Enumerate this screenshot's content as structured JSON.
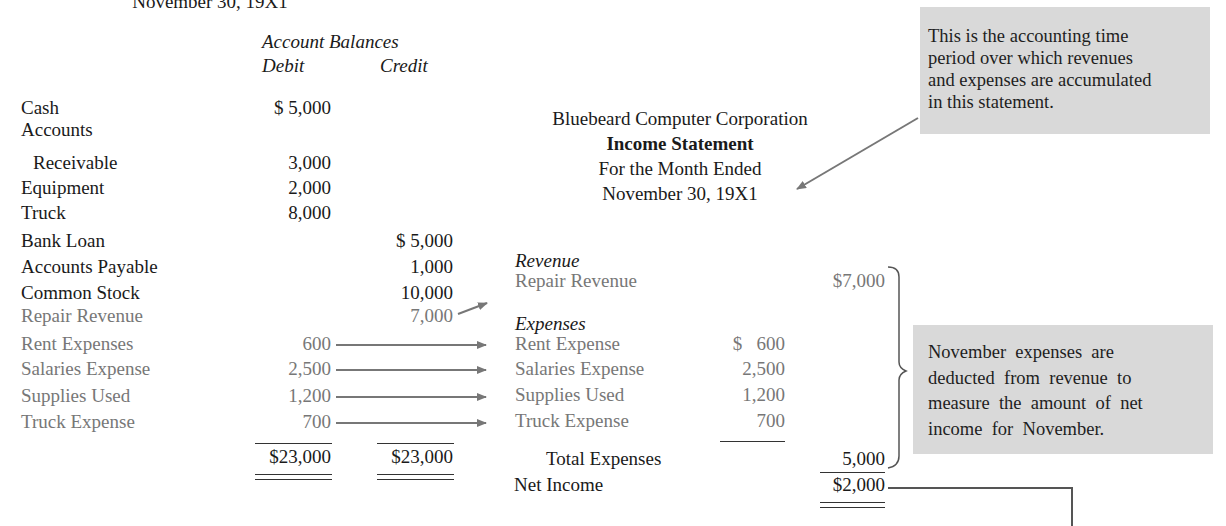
{
  "trial_balance": {
    "date_fragment": "November 30, 19X1",
    "heading": "Account Balances",
    "col_debit": "Debit",
    "col_credit": "Credit",
    "rows": [
      {
        "account": "Cash",
        "debit": "$ 5,000",
        "credit": "",
        "gray": false
      },
      {
        "account": "Accounts",
        "debit": "",
        "credit": "",
        "gray": false
      },
      {
        "account": "Receivable",
        "debit": "3,000",
        "credit": "",
        "gray": false,
        "indent": true
      },
      {
        "account": "Equipment",
        "debit": "2,000",
        "credit": "",
        "gray": false
      },
      {
        "account": "Truck",
        "debit": "8,000",
        "credit": "",
        "gray": false
      },
      {
        "account": "Bank Loan",
        "debit": "",
        "credit": "$ 5,000",
        "gray": false
      },
      {
        "account": "Accounts Payable",
        "debit": "",
        "credit": "1,000",
        "gray": false
      },
      {
        "account": "Common Stock",
        "debit": "",
        "credit": "10,000",
        "gray": false
      },
      {
        "account": "Repair Revenue",
        "debit": "",
        "credit": "7,000",
        "gray": true
      },
      {
        "account": "Rent Expenses",
        "debit": "600",
        "credit": "",
        "gray": true
      },
      {
        "account": "Salaries Expense",
        "debit": "2,500",
        "credit": "",
        "gray": true
      },
      {
        "account": "Supplies Used",
        "debit": "1,200",
        "credit": "",
        "gray": true
      },
      {
        "account": "Truck Expense",
        "debit": "700",
        "credit": "",
        "gray": true
      }
    ],
    "total_debit": "$23,000",
    "total_credit": "$23,000"
  },
  "income_statement": {
    "company": "Bluebeard Computer Corporation",
    "title": "Income Statement",
    "period_line1": "For the Month Ended",
    "period_line2": "November 30, 19X1",
    "revenue_heading": "Revenue",
    "revenue_item": {
      "label": "Repair Revenue",
      "amount": "$7,000"
    },
    "expenses_heading": "Expenses",
    "expense_items": [
      {
        "label": "Rent Expense",
        "amount": "$   600"
      },
      {
        "label": "Salaries Expense",
        "amount": "2,500"
      },
      {
        "label": "Supplies Used",
        "amount": "1,200"
      },
      {
        "label": "Truck Expense",
        "amount": "700"
      }
    ],
    "total_expenses_label": "Total Expenses",
    "total_expenses_amount": "5,000",
    "net_income_label": "Net Income",
    "net_income_amount": "$2,000"
  },
  "annotations": {
    "period_note": [
      "This is the accounting time",
      "period over which revenues",
      "and expenses are accumulated",
      "in this statement."
    ],
    "expenses_note": [
      "November  expenses  are",
      "deducted  from  revenue  to",
      "measure  the  amount  of  net",
      "income  for  November."
    ]
  },
  "colors": {
    "text": "#1a1a1a",
    "gray_text": "#777777",
    "note_bg": "#d9d9d9",
    "arrow": "#777777"
  }
}
